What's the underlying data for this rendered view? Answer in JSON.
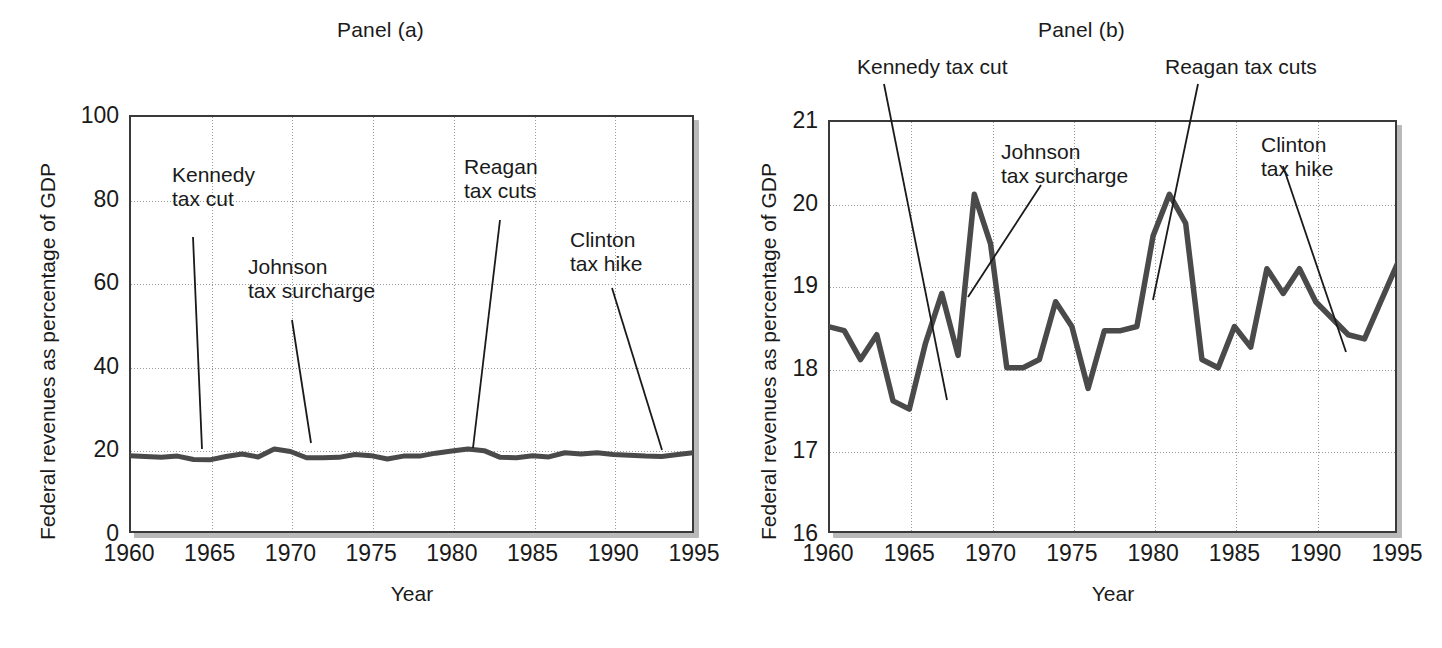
{
  "figure": {
    "axis_label_y": "Federal revenues as percentage of GDP",
    "axis_label_x": "Year"
  },
  "panels": [
    {
      "id": "a",
      "title": "Panel (a)",
      "annotations": [
        {
          "name": "kennedy",
          "lines": [
            "Kennedy",
            "tax cut"
          ]
        },
        {
          "name": "johnson",
          "lines": [
            "Johnson",
            "tax surcharge"
          ]
        },
        {
          "name": "reagan",
          "lines": [
            "Reagan",
            "tax cuts"
          ]
        },
        {
          "name": "clinton",
          "lines": [
            "Clinton",
            "tax hike"
          ]
        }
      ]
    },
    {
      "id": "b",
      "title": "Panel (b)",
      "annotations": [
        {
          "name": "kennedy",
          "lines": [
            "Kennedy tax cut"
          ]
        },
        {
          "name": "johnson",
          "lines": [
            "Johnson",
            "tax surcharge"
          ]
        },
        {
          "name": "reagan",
          "lines": [
            "Reagan tax cuts"
          ]
        },
        {
          "name": "clinton",
          "lines": [
            "Clinton",
            "tax hike"
          ]
        }
      ]
    }
  ],
  "chart_data": [
    {
      "type": "line",
      "title": "Panel (a)",
      "xlabel": "Year",
      "ylabel": "Federal revenues as percentage of GDP",
      "xlim": [
        1960,
        1995
      ],
      "ylim": [
        0,
        100
      ],
      "xticks": [
        1960,
        1965,
        1970,
        1975,
        1980,
        1985,
        1990,
        1995
      ],
      "yticks": [
        0,
        20,
        40,
        60,
        80,
        100
      ],
      "grid": true,
      "legend": "none",
      "x": [
        1960,
        1961,
        1962,
        1963,
        1964,
        1965,
        1966,
        1967,
        1968,
        1969,
        1970,
        1971,
        1972,
        1973,
        1974,
        1975,
        1976,
        1977,
        1978,
        1979,
        1980,
        1981,
        1982,
        1983,
        1984,
        1985,
        1986,
        1987,
        1988,
        1989,
        1990,
        1991,
        1992,
        1993,
        1994,
        1995
      ],
      "values": [
        18.5,
        18.3,
        18.1,
        18.4,
        17.6,
        17.5,
        18.3,
        18.9,
        18.2,
        20.1,
        19.5,
        18.0,
        18.0,
        18.1,
        18.8,
        18.5,
        17.7,
        18.4,
        18.4,
        19.1,
        19.6,
        20.1,
        19.7,
        18.1,
        18.0,
        18.5,
        18.2,
        19.2,
        18.9,
        19.2,
        18.8,
        18.6,
        18.4,
        18.3,
        18.8,
        19.2
      ],
      "annotations": [
        {
          "label": "Kennedy tax cut",
          "x": 1964,
          "y": 17.6
        },
        {
          "label": "Johnson tax surcharge",
          "x": 1969,
          "y": 20.1
        },
        {
          "label": "Reagan tax cuts",
          "x": 1981,
          "y": 20.1
        },
        {
          "label": "Clinton tax hike",
          "x": 1993,
          "y": 18.3
        }
      ]
    },
    {
      "type": "line",
      "title": "Panel (b)",
      "xlabel": "Year",
      "ylabel": "Federal revenues as percentage of GDP",
      "xlim": [
        1960,
        1995
      ],
      "ylim": [
        16,
        21
      ],
      "xticks": [
        1960,
        1965,
        1970,
        1975,
        1980,
        1985,
        1990,
        1995
      ],
      "yticks": [
        16,
        17,
        18,
        19,
        20,
        21
      ],
      "grid": true,
      "legend": "none",
      "x": [
        1960,
        1961,
        1962,
        1963,
        1964,
        1965,
        1966,
        1967,
        1968,
        1969,
        1970,
        1971,
        1972,
        1973,
        1974,
        1975,
        1976,
        1977,
        1978,
        1979,
        1980,
        1981,
        1982,
        1983,
        1984,
        1985,
        1986,
        1987,
        1988,
        1989,
        1990,
        1991,
        1992,
        1993,
        1994,
        1995
      ],
      "values": [
        18.5,
        18.45,
        18.1,
        18.4,
        17.6,
        17.5,
        18.3,
        18.9,
        18.15,
        20.1,
        19.5,
        18.0,
        18.0,
        18.1,
        18.8,
        18.5,
        17.75,
        18.45,
        18.45,
        18.5,
        19.6,
        20.1,
        19.75,
        18.1,
        18.0,
        18.5,
        18.25,
        19.2,
        18.9,
        19.2,
        18.8,
        18.6,
        18.4,
        18.35,
        18.8,
        19.25
      ],
      "annotations": [
        {
          "label": "Kennedy tax cut",
          "x": 1964,
          "y": 17.6
        },
        {
          "label": "Johnson tax surcharge",
          "x": 1969,
          "y": 20.1
        },
        {
          "label": "Reagan tax cuts",
          "x": 1981,
          "y": 20.1
        },
        {
          "label": "Clinton tax hike",
          "x": 1993,
          "y": 18.35
        }
      ]
    }
  ]
}
